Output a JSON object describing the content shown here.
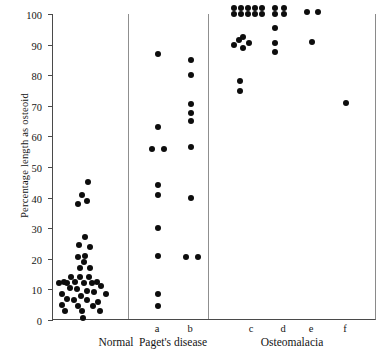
{
  "chart_data": {
    "type": "scatter",
    "title": "",
    "xlabel": "",
    "ylabel": "Percentage length as osteoid",
    "ylim": [
      0,
      100
    ],
    "yticks": [
      0,
      10,
      20,
      30,
      40,
      50,
      60,
      70,
      80,
      90,
      100
    ],
    "grid": false,
    "legend": null,
    "note": "Dot-strip / one-dimensional scatter plot. Values are percentage length as osteoid for individual measurements, grouped into three panels separated by vertical rules.",
    "panels": [
      {
        "name": "Normal",
        "label": "Normal",
        "sublabels": [],
        "series": [
          {
            "name": "Normal",
            "sublabel": "",
            "values": [
              45,
              41,
              39,
              38,
              27,
              24.5,
              24,
              21,
              20.5,
              19,
              17,
              17,
              14,
              14,
              13,
              12.5,
              12.5,
              12.5,
              12,
              12,
              12,
              12,
              11,
              10.5,
              10,
              9.5,
              9,
              8.5,
              8.5,
              8,
              7,
              6.5,
              6.5,
              6,
              5,
              4.5,
              4.5,
              3,
              3,
              2.5,
              0.5
            ]
          }
        ]
      },
      {
        "name": "Paget's disease",
        "label": "Paget's disease",
        "sublabels": [
          "a",
          "b"
        ],
        "series": [
          {
            "name": "Paget's disease a",
            "sublabel": "a",
            "values": [
              87,
              63,
              56,
              56,
              44,
              41,
              30,
              21,
              8.5,
              4.5
            ]
          },
          {
            "name": "Paget's disease b",
            "sublabel": "b",
            "values": [
              85,
              80,
              70.5,
              67.5,
              65,
              56.5,
              40,
              20.5,
              20.5
            ]
          }
        ]
      },
      {
        "name": "Osteomalacia",
        "label": "Osteomalacia",
        "sublabels": [
          "c",
          "d",
          "e",
          "f"
        ],
        "series": [
          {
            "name": "Osteomalacia c",
            "sublabel": "c",
            "values": [
              102,
              102,
              102,
              102,
              102,
              100,
              100,
              100,
              100,
              100,
              92.5,
              91.5,
              90.5,
              90,
              89,
              78,
              75
            ]
          },
          {
            "name": "Osteomalacia d",
            "sublabel": "d",
            "values": [
              102,
              102,
              100,
              100,
              95.5,
              90.5,
              87.5
            ]
          },
          {
            "name": "Osteomalacia e",
            "sublabel": "e",
            "values": [
              100.5,
              100.5,
              91
            ]
          },
          {
            "name": "Osteomalacia f",
            "sublabel": "f",
            "values": [
              71
            ]
          }
        ]
      }
    ]
  },
  "layout": {
    "separators_px": [
      75,
      155
    ],
    "sublabel_x_px": [
      {
        "label": "a",
        "x": 105
      },
      {
        "label": "b",
        "x": 138
      },
      {
        "label": "c",
        "x": 199
      },
      {
        "label": "d",
        "x": 231
      },
      {
        "label": "e",
        "x": 259
      },
      {
        "label": "f",
        "x": 293
      }
    ],
    "grouplabel_x_px": [
      {
        "label": "Normal",
        "x": 64
      },
      {
        "label": "Paget's disease",
        "x": 121
      },
      {
        "label": "Osteomalacia",
        "x": 240
      }
    ],
    "points_px": {
      "normal": [
        [
          35,
          45
        ],
        [
          29,
          41
        ],
        [
          34,
          39
        ],
        [
          25,
          38
        ],
        [
          32,
          27
        ],
        [
          26,
          24.5
        ],
        [
          37,
          24
        ],
        [
          32,
          21
        ],
        [
          25,
          20.5
        ],
        [
          31,
          19
        ],
        [
          27,
          17
        ],
        [
          37,
          17
        ],
        [
          18,
          14
        ],
        [
          27,
          14
        ],
        [
          36,
          14
        ],
        [
          11,
          12.5
        ],
        [
          44,
          12.5
        ],
        [
          22,
          12.5
        ],
        [
          31,
          12
        ],
        [
          39,
          12
        ],
        [
          14,
          12
        ],
        [
          6,
          12
        ],
        [
          48,
          11
        ],
        [
          17,
          10.5
        ],
        [
          24,
          10
        ],
        [
          34,
          9.5
        ],
        [
          41,
          9
        ],
        [
          9,
          8.5
        ],
        [
          53,
          8.5
        ],
        [
          28,
          8
        ],
        [
          14,
          7
        ],
        [
          21,
          6.5
        ],
        [
          34,
          6.5
        ],
        [
          45,
          6
        ],
        [
          9,
          5
        ],
        [
          25,
          4.5
        ],
        [
          40,
          4.5
        ],
        [
          12,
          3
        ],
        [
          29,
          3
        ],
        [
          47,
          3
        ],
        [
          30,
          0.5
        ]
      ],
      "paget_a": [
        [
          105,
          87
        ],
        [
          105,
          63
        ],
        [
          99,
          56
        ],
        [
          111,
          56
        ],
        [
          105,
          44
        ],
        [
          105,
          41
        ],
        [
          105,
          30
        ],
        [
          105,
          21
        ],
        [
          105,
          8.5
        ],
        [
          105,
          4.5
        ]
      ],
      "paget_b": [
        [
          138,
          85
        ],
        [
          138,
          80
        ],
        [
          138,
          70.5
        ],
        [
          138,
          67.5
        ],
        [
          138,
          65
        ],
        [
          138,
          56.5
        ],
        [
          138,
          40
        ],
        [
          133,
          20.5
        ],
        [
          145,
          20.5
        ]
      ],
      "osteo_c": [
        [
          181,
          102
        ],
        [
          188,
          102
        ],
        [
          195,
          102
        ],
        [
          202,
          102
        ],
        [
          209,
          102
        ],
        [
          181,
          100
        ],
        [
          188,
          100
        ],
        [
          195,
          100
        ],
        [
          202,
          100
        ],
        [
          209,
          100
        ],
        [
          190,
          92.5
        ],
        [
          186,
          91.5
        ],
        [
          196,
          90.5
        ],
        [
          181,
          90
        ],
        [
          190,
          89
        ],
        [
          187,
          78
        ],
        [
          187,
          75
        ]
      ],
      "osteo_d": [
        [
          222,
          102
        ],
        [
          231,
          102
        ],
        [
          222,
          100
        ],
        [
          231,
          100
        ],
        [
          222,
          95.5
        ],
        [
          222,
          90.5
        ],
        [
          222,
          87.5
        ]
      ],
      "osteo_e": [
        [
          254,
          100.5
        ],
        [
          265,
          100.5
        ],
        [
          259,
          91
        ]
      ],
      "osteo_f": [
        [
          293,
          71
        ]
      ]
    }
  }
}
